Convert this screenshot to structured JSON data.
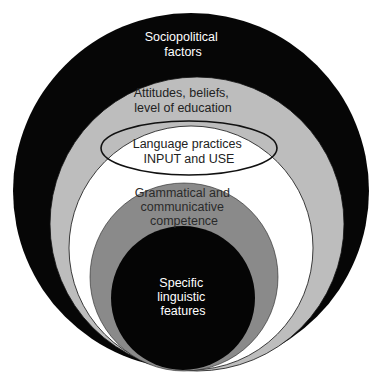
{
  "diagram": {
    "type": "nested-circles",
    "colors": {
      "background": "#ffffff",
      "outer": "#060606",
      "attitudes": "#bdbdbd",
      "practices": "#ffffff",
      "competence": "#8a8a8a",
      "features": "#050505",
      "light_text": "#ffffff",
      "dark_text": "#222222"
    },
    "layers": [
      {
        "id": "sociopolitical",
        "lines": [
          "Sociopolitical",
          "factors"
        ]
      },
      {
        "id": "attitudes",
        "lines": [
          "Attitudes, beliefs,",
          "level of education"
        ]
      },
      {
        "id": "practices",
        "lines": [
          "Language practices",
          "INPUT and USE"
        ]
      },
      {
        "id": "competence",
        "lines": [
          "Grammatical and",
          "communicative",
          "competence"
        ]
      },
      {
        "id": "features",
        "lines": [
          "Specific",
          "linguistic",
          "features"
        ]
      }
    ]
  }
}
